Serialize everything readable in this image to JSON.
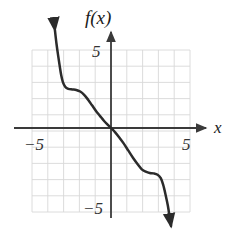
{
  "figure": {
    "title": "",
    "width": 236,
    "height": 242,
    "background_color": "#ffffff"
  },
  "labels": {
    "function_label": "f(x)",
    "x_axis_label": "x",
    "x_tick_negative": "−5",
    "x_tick_positive": "5",
    "y_tick_positive": "5",
    "y_tick_negative": "−5"
  },
  "colors": {
    "curve": "#2b2b2b",
    "axis": "#3a3a3a",
    "grid": "#d8d8d8",
    "text": "#1a1a1a"
  },
  "chart_data": {
    "type": "line",
    "title": "",
    "xlabel": "x",
    "ylabel": "f(x)",
    "xlim": [
      -5,
      5
    ],
    "ylim": [
      -5,
      5
    ],
    "grid": true,
    "legend": "none",
    "xticks": [
      -5,
      5
    ],
    "yticks": [
      -5,
      5
    ],
    "xtick_labels": [
      "−5",
      "5"
    ],
    "ytick_labels": [
      "5",
      "−5"
    ],
    "axis_arrows": {
      "x_positive": true,
      "x_negative": false,
      "y_positive": true,
      "y_negative": false
    },
    "series": [
      {
        "name": "f(x)",
        "color": "#2b2b2b",
        "arrow_start": true,
        "arrow_end": true,
        "points": [
          [
            -3.55,
            6.05
          ],
          [
            -3.45,
            5.2
          ],
          [
            -3.35,
            4.5
          ],
          [
            -3.25,
            3.85
          ],
          [
            -3.15,
            3.25
          ],
          [
            -3.05,
            2.85
          ],
          [
            -2.9,
            2.55
          ],
          [
            -2.7,
            2.42
          ],
          [
            -2.45,
            2.38
          ],
          [
            -2.2,
            2.35
          ],
          [
            -1.95,
            2.25
          ],
          [
            -1.7,
            2.05
          ],
          [
            -1.45,
            1.75
          ],
          [
            -1.2,
            1.4
          ],
          [
            -0.95,
            1.05
          ],
          [
            -0.7,
            0.75
          ],
          [
            -0.45,
            0.45
          ],
          [
            -0.2,
            0.2
          ],
          [
            0,
            0
          ],
          [
            0.25,
            -0.25
          ],
          [
            0.5,
            -0.55
          ],
          [
            0.8,
            -0.95
          ],
          [
            1.1,
            -1.4
          ],
          [
            1.4,
            -1.85
          ],
          [
            1.7,
            -2.25
          ],
          [
            1.95,
            -2.55
          ],
          [
            2.2,
            -2.7
          ],
          [
            2.45,
            -2.78
          ],
          [
            2.7,
            -2.8
          ],
          [
            2.95,
            -2.88
          ],
          [
            3.15,
            -3.1
          ],
          [
            3.3,
            -3.5
          ],
          [
            3.45,
            -4.1
          ],
          [
            3.6,
            -4.8
          ],
          [
            3.72,
            -5.55
          ],
          [
            3.8,
            -6.05
          ]
        ]
      }
    ]
  }
}
